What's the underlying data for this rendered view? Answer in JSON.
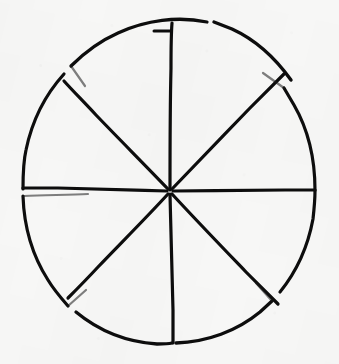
{
  "figure": {
    "alt_text": "A roughly hand-drawn circle cut by four diameters into eight pie sectors, with small wedge-shaped gaps where some sectors are slightly separated",
    "kind": "line-drawing",
    "background_color": "#f7f7f6",
    "ink_color": "#0d0d0d",
    "stroke_width_px": 3,
    "canvas": {
      "width": 339,
      "height": 364
    }
  },
  "chart_data": {
    "type": "pie",
    "title": "",
    "subtitle": "",
    "xlabel": "",
    "ylabel": "",
    "legend": [],
    "legend_position": "none",
    "grid": false,
    "labels_shown": false,
    "values_shown": false,
    "center": {
      "x": 170,
      "y": 192
    },
    "radius": 148,
    "slice_count": 8,
    "categories": [
      "1",
      "2",
      "3",
      "4",
      "5",
      "6",
      "7",
      "8"
    ],
    "values": [
      12.5,
      12.5,
      12.5,
      12.5,
      12.5,
      12.5,
      12.5,
      12.5
    ],
    "units": "percent",
    "slices": [
      {
        "id": "slice-1",
        "start_deg": 45,
        "end_deg": 90,
        "value": 12.5,
        "exploded": true,
        "fill": "none",
        "stroke": "#0d0d0d"
      },
      {
        "id": "slice-2",
        "start_deg": 90,
        "end_deg": 135,
        "value": 12.5,
        "exploded": false,
        "fill": "none",
        "stroke": "#0d0d0d"
      },
      {
        "id": "slice-3",
        "start_deg": 135,
        "end_deg": 180,
        "value": 12.5,
        "exploded": false,
        "fill": "none",
        "stroke": "#0d0d0d"
      },
      {
        "id": "slice-4",
        "start_deg": 180,
        "end_deg": 225,
        "value": 12.5,
        "exploded": false,
        "fill": "none",
        "stroke": "#0d0d0d"
      },
      {
        "id": "slice-5",
        "start_deg": 225,
        "end_deg": 270,
        "value": 12.5,
        "exploded": false,
        "fill": "none",
        "stroke": "#0d0d0d"
      },
      {
        "id": "slice-6",
        "start_deg": 270,
        "end_deg": 315,
        "value": 12.5,
        "exploded": false,
        "fill": "none",
        "stroke": "#0d0d0d"
      },
      {
        "id": "slice-7",
        "start_deg": 315,
        "end_deg": 360,
        "value": 12.5,
        "exploded": false,
        "fill": "none",
        "stroke": "#0d0d0d"
      },
      {
        "id": "slice-8",
        "start_deg": 0,
        "end_deg": 45,
        "value": 12.5,
        "exploded": false,
        "fill": "none",
        "stroke": "#0d0d0d"
      }
    ],
    "gaps_deg": [
      45,
      90,
      135,
      225,
      315
    ],
    "annotations": []
  }
}
